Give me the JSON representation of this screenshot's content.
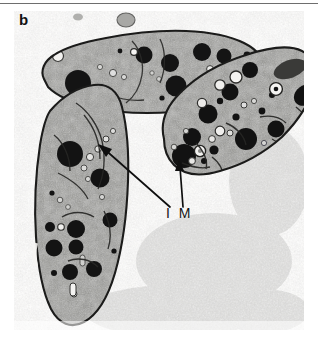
{
  "figure": {
    "panel_label": "b",
    "type": "transmission-electron-micrograph",
    "annotation_label": "I M",
    "annotation_meaning": "intracytoplasmic membrane",
    "background_color": "#ffffff",
    "rule_color": "#6e6e6e",
    "matrix_color": "#eeedec",
    "cytoplasm_color": "#8d8d8a",
    "granule_color": "#151515",
    "envelope_color": "#1d1d1d",
    "arrow_color": "#0f0f0f"
  },
  "micrograph": {
    "left": 14,
    "top": 11,
    "width": 290,
    "height": 319
  },
  "cells": [
    {
      "name": "cell-top",
      "orientation": "horizontal-elongated",
      "granule_count": 12
    },
    {
      "name": "cell-left",
      "orientation": "vertical-elongated",
      "granule_count": 13
    },
    {
      "name": "cell-right",
      "orientation": "diagonal-elongated",
      "granule_count": 16
    }
  ],
  "arrows": [
    {
      "name": "arrow-to-left-cell",
      "from": [
        168,
        206
      ],
      "to": [
        98,
        145
      ]
    },
    {
      "name": "arrow-to-right-cell",
      "from": [
        183,
        205
      ],
      "to": [
        179,
        160
      ]
    }
  ]
}
